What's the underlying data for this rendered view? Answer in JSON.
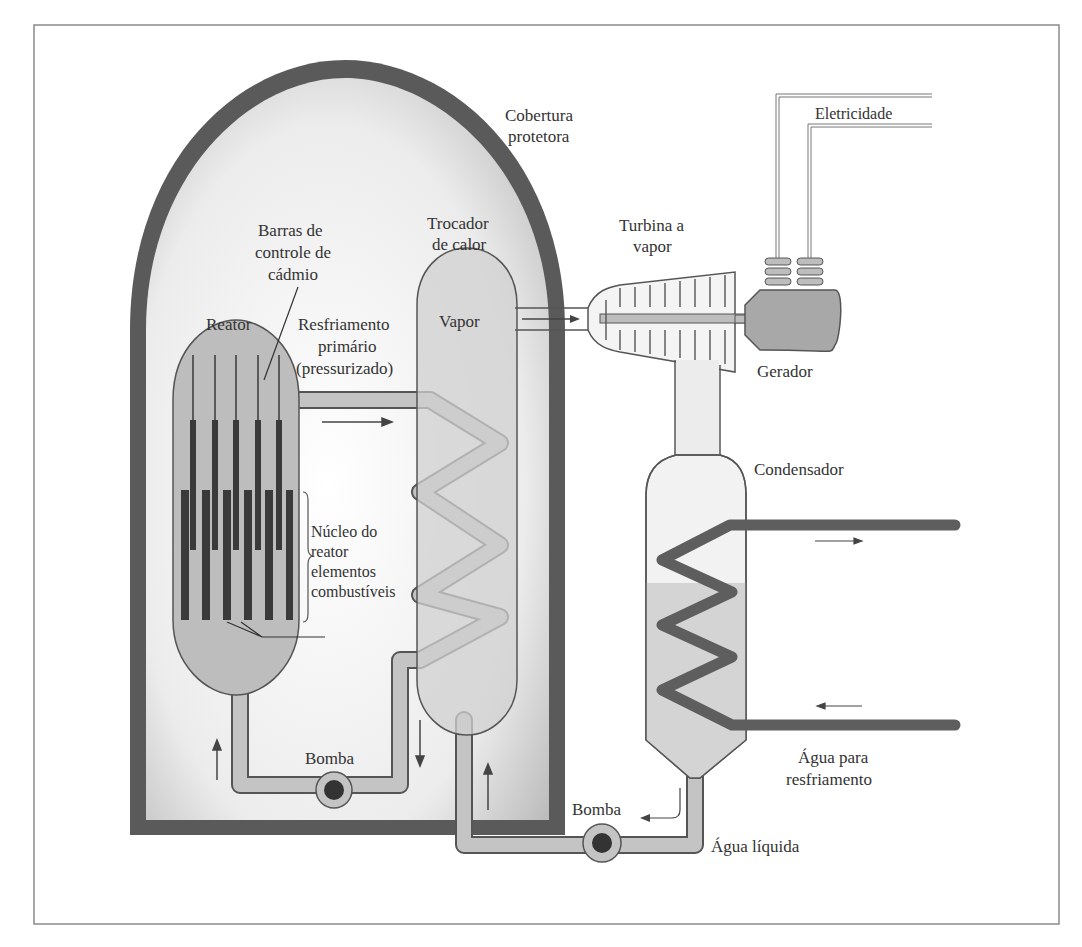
{
  "figure": {
    "type": "nuclear-power-plant-schematic",
    "language": "pt"
  },
  "labels": {
    "containment": [
      "Cobertura",
      "protetora"
    ],
    "electricity": "Eletricidade",
    "heat_exchanger": [
      "Trocador",
      "de calor"
    ],
    "turbine": [
      "Turbina a",
      "vapor"
    ],
    "control_rods": [
      "Barras de",
      "controle de",
      "cádmio"
    ],
    "reactor": "Reator",
    "primary_coolant": [
      "Resfriamento",
      "primário",
      "(pressurizado)"
    ],
    "steam": "Vapor",
    "generator": "Gerador",
    "condenser": "Condensador",
    "core": [
      "Núcleo do",
      "reator",
      "elementos",
      "combustíveis"
    ],
    "pump_primary": "Bomba",
    "pump_secondary": "Bomba",
    "cooling_water": [
      "Água para",
      "resfriamento"
    ],
    "liquid_water": "Água líquida"
  },
  "colors": {
    "containment_wall": "#5a5a5a",
    "containment_fill": "#e2e2e2",
    "vessel_fill": "#bdbdbd",
    "pipe_fill": "#c4c4c4",
    "cooling_pipe": "#5e5e5e",
    "rod_dark": "#3a3a3a",
    "outline": "#555555",
    "text": "#333333",
    "frame": "#8a8a8a"
  }
}
